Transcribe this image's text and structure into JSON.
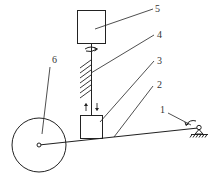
{
  "diagram": {
    "type": "mechanism-schematic",
    "stroke_color": "#222222",
    "background": "#ffffff",
    "labels": [
      {
        "id": "label-1",
        "text": "1",
        "x": 160,
        "y": 113
      },
      {
        "id": "label-2",
        "text": "2",
        "x": 157,
        "y": 88
      },
      {
        "id": "label-3",
        "text": "3",
        "x": 157,
        "y": 64
      },
      {
        "id": "label-4",
        "text": "4",
        "x": 157,
        "y": 38
      },
      {
        "id": "label-5",
        "text": "5",
        "x": 155,
        "y": 12
      },
      {
        "id": "label-6",
        "text": "6",
        "x": 52,
        "y": 63
      }
    ],
    "components": [
      {
        "number": "1",
        "name": "pivot-support"
      },
      {
        "number": "2",
        "name": "lever-arm"
      },
      {
        "number": "3",
        "name": "slider-block"
      },
      {
        "number": "4",
        "name": "screw-shaft"
      },
      {
        "number": "5",
        "name": "motor-box"
      },
      {
        "number": "6",
        "name": "wheel"
      }
    ]
  }
}
